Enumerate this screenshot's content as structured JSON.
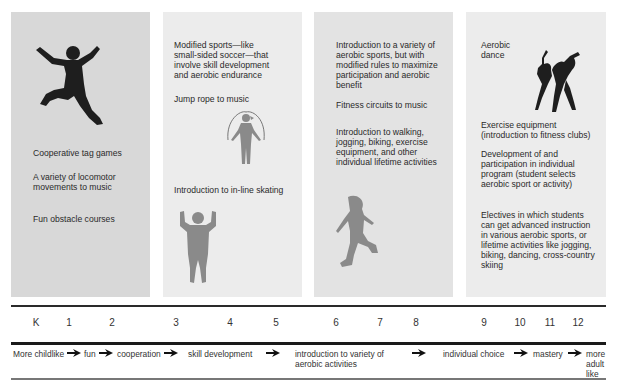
{
  "panels": [
    {
      "items": [
        "Cooperative tag games",
        "A variety of locomotor movements to music",
        "Fun obstacle courses"
      ],
      "figure": "jumping-child-icon"
    },
    {
      "items": [
        "Modified sports—like small-sided soccer—that involve skill development and aerobic endurance",
        "Jump rope to music",
        "Introduction to in-line skating"
      ],
      "figures": [
        "jump-rope-child-icon",
        "flexing-child-icon"
      ]
    },
    {
      "items": [
        "Introduction to a variety of aerobic sports, but with modified rules to maximize participation and aerobic benefit",
        "Fitness circuits to music",
        "Introduction to walking, jogging, biking, exercise equipment, and other individual lifetime activities"
      ],
      "figure": "inline-skater-icon"
    },
    {
      "items": [
        "Aerobic dance",
        "Exercise equipment (introduction to fitness clubs)",
        "Development of and participation in individual program (student selects aerobic sport or activity)",
        "Electives in which students can get advanced instruction in various aerobic sports, or lifetime activities like jogging, biking, dancing, cross-country skiing"
      ],
      "figure": "aerobic-dancers-icon"
    }
  ],
  "grades": [
    "K",
    "1",
    "2",
    "3",
    "4",
    "5",
    "6",
    "7",
    "8",
    "9",
    "10",
    "11",
    "12"
  ],
  "progression": [
    "More childlike",
    "fun",
    "cooperation",
    "skill development",
    "introduction to variety of aerobic activities",
    "individual choice",
    "mastery",
    "more adult like"
  ],
  "colors": {
    "panel_1": "#d8d8d8",
    "panel_2": "#ececec",
    "panel_3": "#e3e3e3",
    "panel_4": "#ececec",
    "silhouette_dark": "#1e1e1e",
    "silhouette_grey": "#8a8a8a"
  }
}
